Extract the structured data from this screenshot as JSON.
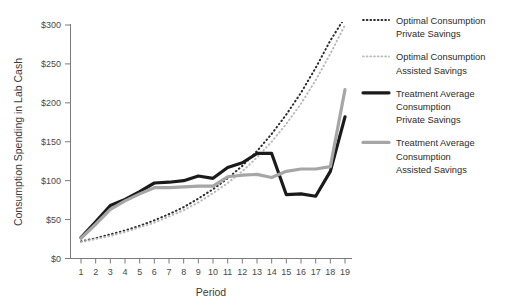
{
  "chart_data": {
    "type": "line",
    "title": "",
    "xlabel": "Period",
    "ylabel": "Consumption Spending in Lab Cash",
    "x": [
      1,
      2,
      3,
      4,
      5,
      6,
      7,
      8,
      9,
      10,
      11,
      12,
      13,
      14,
      15,
      16,
      17,
      18,
      19
    ],
    "xlim": [
      1,
      19
    ],
    "ylim": [
      0,
      300
    ],
    "xtick_labels": [
      "1",
      "2",
      "3",
      "4",
      "5",
      "6",
      "7",
      "8",
      "9",
      "10",
      "11",
      "12",
      "13",
      "14",
      "15",
      "16",
      "17",
      "18",
      "19"
    ],
    "ytick_values": [
      0,
      50,
      100,
      150,
      200,
      250,
      300
    ],
    "ytick_labels": [
      "$0",
      "$50",
      "$100",
      "$150",
      "$200",
      "$250",
      "$300"
    ],
    "grid": false,
    "legend_position": "right",
    "series": [
      {
        "name": "Optimal Consumption Private Savings",
        "legend_lines": [
          "Optimal Consumption",
          "Private Savings"
        ],
        "style": "dotted",
        "color": "#2b2b2b",
        "width": 2,
        "values": [
          22,
          26,
          31,
          36,
          42,
          49,
          57,
          66,
          77,
          89,
          103,
          119,
          138,
          160,
          185,
          213,
          245,
          280,
          310
        ]
      },
      {
        "name": "Optimal Consumption Assisted Savings",
        "legend_lines": [
          "Optimal Consumption",
          "Assisted Savings"
        ],
        "style": "dotted",
        "color": "#b9b9b9",
        "width": 2,
        "values": [
          21,
          25,
          29,
          34,
          40,
          46,
          54,
          62,
          72,
          84,
          97,
          112,
          130,
          150,
          173,
          199,
          229,
          263,
          300
        ]
      },
      {
        "name": "Treatment Average Consumption Private Savings",
        "legend_lines": [
          "Treatment Average",
          "Consumption",
          "Private Savings"
        ],
        "style": "solid",
        "color": "#1a1a1a",
        "width": 3.2,
        "values": [
          27,
          47,
          68,
          76,
          86,
          97,
          98,
          100,
          106,
          103,
          117,
          123,
          135,
          135,
          82,
          83,
          80,
          112,
          182
        ]
      },
      {
        "name": "Treatment Average Consumption Assisted Savings",
        "legend_lines": [
          "Treatment Average",
          "Consumption",
          "Assisted Savings"
        ],
        "style": "solid",
        "color": "#a6a6a6",
        "width": 3.2,
        "values": [
          26,
          44,
          63,
          74,
          83,
          91,
          91,
          92,
          93,
          93,
          105,
          107,
          108,
          104,
          112,
          115,
          115,
          118,
          217
        ]
      }
    ]
  },
  "legend": {
    "entries": [
      {
        "lines": [
          "Optimal Consumption",
          "Private Savings"
        ],
        "marker": "dotted-dark"
      },
      {
        "lines": [
          "Optimal Consumption",
          "Assisted Savings"
        ],
        "marker": "dotted-light"
      },
      {
        "lines": [
          "Treatment Average",
          "Consumption",
          "Private Savings"
        ],
        "marker": "solid-dark"
      },
      {
        "lines": [
          "Treatment Average",
          "Consumption",
          "Assisted Savings"
        ],
        "marker": "solid-light"
      }
    ]
  },
  "colors": {
    "optimal_private": "#2b2b2b",
    "optimal_assisted": "#b9b9b9",
    "treatment_private": "#1a1a1a",
    "treatment_assisted": "#a6a6a6",
    "axis": "#7b7b7b",
    "text": "#2b2b2b",
    "background": "#ffffff"
  }
}
